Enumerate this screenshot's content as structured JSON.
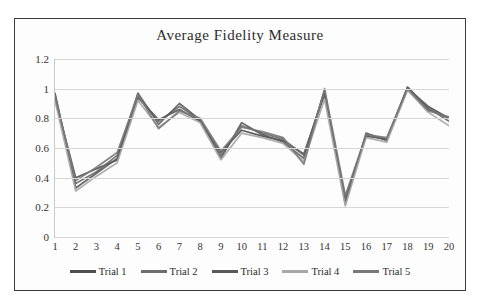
{
  "chart_data": {
    "type": "line",
    "title": "Average Fidelity Measure",
    "xlabel": "",
    "ylabel": "",
    "ylim": [
      0,
      1.2
    ],
    "yticks": [
      "0",
      "0.2",
      "0.4",
      "0.6",
      "0.8",
      "1",
      "1.2"
    ],
    "ytick_values": [
      0,
      0.2,
      0.4,
      0.6,
      0.8,
      1,
      1.2
    ],
    "grid": true,
    "legend_position": "bottom",
    "categories": [
      "1",
      "2",
      "3",
      "4",
      "5",
      "6",
      "7",
      "8",
      "9",
      "10",
      "11",
      "12",
      "13",
      "14",
      "15",
      "16",
      "17",
      "18",
      "19",
      "20"
    ],
    "x": [
      1,
      2,
      3,
      4,
      5,
      6,
      7,
      8,
      9,
      10,
      11,
      12,
      13,
      14,
      15,
      16,
      17,
      18,
      19,
      20
    ],
    "series": [
      {
        "name": "Trial 1",
        "color": "#4f4f4f",
        "values": [
          0.93,
          0.4,
          0.46,
          0.52,
          0.94,
          0.79,
          0.86,
          0.78,
          0.57,
          0.72,
          0.68,
          0.65,
          0.56,
          0.96,
          0.26,
          0.68,
          0.66,
          1.0,
          0.88,
          0.8
        ]
      },
      {
        "name": "Trial 2",
        "color": "#6e6e6e",
        "values": [
          0.96,
          0.36,
          0.44,
          0.55,
          0.95,
          0.78,
          0.88,
          0.79,
          0.55,
          0.75,
          0.7,
          0.66,
          0.55,
          0.98,
          0.24,
          0.69,
          0.66,
          1.01,
          0.87,
          0.78
        ]
      },
      {
        "name": "Trial 3",
        "color": "#5a5a5a",
        "values": [
          0.97,
          0.33,
          0.43,
          0.53,
          0.97,
          0.76,
          0.9,
          0.79,
          0.53,
          0.77,
          0.69,
          0.64,
          0.53,
          0.99,
          0.22,
          0.7,
          0.65,
          1.01,
          0.86,
          0.8
        ]
      },
      {
        "name": "Trial 4",
        "color": "#a8a8a8",
        "values": [
          0.92,
          0.31,
          0.41,
          0.5,
          0.92,
          0.74,
          0.84,
          0.77,
          0.52,
          0.7,
          0.67,
          0.63,
          0.51,
          0.93,
          0.21,
          0.67,
          0.64,
          0.99,
          0.84,
          0.75
        ]
      },
      {
        "name": "Trial 5",
        "color": "#797979",
        "values": [
          0.95,
          0.38,
          0.47,
          0.57,
          0.96,
          0.73,
          0.85,
          0.8,
          0.58,
          0.74,
          0.71,
          0.67,
          0.49,
          1.0,
          0.28,
          0.69,
          0.67,
          1.0,
          0.85,
          0.81
        ]
      }
    ]
  },
  "legend": {
    "items": [
      {
        "label": "Trial 1"
      },
      {
        "label": "Trial 2"
      },
      {
        "label": "Trial 3"
      },
      {
        "label": "Trial 4"
      },
      {
        "label": "Trial 5"
      }
    ]
  },
  "colors": {
    "frame_border": "#3b3b3b",
    "gridline": "#d6d6d6",
    "text": "#2c2c2c",
    "background": "#ffffff"
  }
}
